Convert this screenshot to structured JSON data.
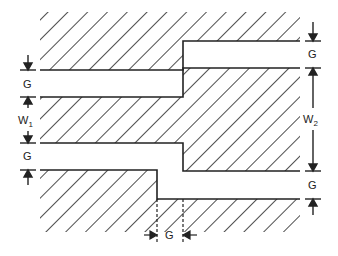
{
  "diagram": {
    "labels": {
      "gap_left_top": "G",
      "w1": "W",
      "w1_sub": "1",
      "gap_left_bottom": "G",
      "gap_right_top": "G",
      "w2": "W",
      "w2_sub": "2",
      "gap_right_bottom": "G",
      "gap_bottom": "G"
    },
    "colors": {
      "line": "#222222",
      "background": "#ffffff"
    }
  }
}
